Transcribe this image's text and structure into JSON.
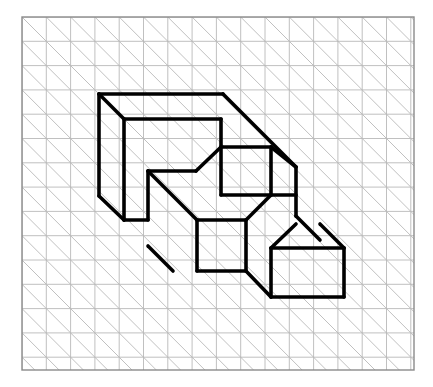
{
  "page": {
    "background_color": "#ffffff",
    "width": 433,
    "height": 387
  },
  "grid_panel": {
    "name": "grid-panel",
    "x": 22,
    "y": 17,
    "width": 392,
    "height": 353,
    "border_color": "#8a8a8a",
    "border_width": 1.4,
    "fill_color": "#ffffff",
    "cell_size": 24.3,
    "columns": 16,
    "rows": 14,
    "grid_line_color": "#b9b9b9",
    "grid_line_width": 0.9,
    "diagonal_color": "#b9b9b9",
    "diagonal_width": 0.9,
    "diagonal_direction": "top-left-to-bottom-right"
  },
  "figure": {
    "name": "isometric-block-figure",
    "stroke_color": "#000000",
    "stroke_width": 3.6,
    "fill_color": "none",
    "projection": "oblique-45-down-right",
    "unit": 24.3,
    "depth_step": 24.3,
    "outline_path": "M 99 94 L 223 94 L 296 167 L 296 216 L 344 216 L 344 297 L 271 297 L 197 271 L 173 271 L 124 220 L 99 196 Z",
    "outline_points": [
      {
        "x": 99,
        "y": 94,
        "label": "top-left-top-corner"
      },
      {
        "x": 223,
        "y": 94,
        "label": "top-right-top-corner"
      },
      {
        "x": 296,
        "y": 167,
        "label": "upper-right-depth-corner"
      },
      {
        "x": 296,
        "y": 216,
        "label": "right-step-top"
      },
      {
        "x": 344,
        "y": 216,
        "label": "far-right-top"
      },
      {
        "x": 344,
        "y": 297,
        "label": "far-right-bottom"
      },
      {
        "x": 271,
        "y": 297,
        "label": "bottom-right-front"
      },
      {
        "x": 197,
        "y": 271,
        "label": "bottom-mid-front"
      },
      {
        "x": 173,
        "y": 271,
        "label": "bottom-mid-left"
      },
      {
        "x": 124,
        "y": 220,
        "label": "bottom-left-front"
      },
      {
        "x": 99,
        "y": 196,
        "label": "left-bottom-corner"
      }
    ],
    "edges": [
      {
        "name": "top-edge-back",
        "x1": 99,
        "y1": 94,
        "x2": 223,
        "y2": 94
      },
      {
        "name": "top-right-diagonal",
        "x1": 223,
        "y1": 94,
        "x2": 296,
        "y2": 167
      },
      {
        "name": "left-edge-vertical",
        "x1": 99,
        "y1": 94,
        "x2": 99,
        "y2": 196
      },
      {
        "name": "left-bottom-diagonal",
        "x1": 99,
        "y1": 196,
        "x2": 124,
        "y2": 220
      },
      {
        "name": "left-foot-horizontal",
        "x1": 124,
        "y1": 220,
        "x2": 148,
        "y2": 220
      },
      {
        "name": "inner-top-diagonal",
        "x1": 99,
        "y1": 94,
        "x2": 124,
        "y2": 119
      },
      {
        "name": "inner-top-horizontal",
        "x1": 124,
        "y1": 119,
        "x2": 221,
        "y2": 119
      },
      {
        "name": "inner-right-vertical-upper",
        "x1": 221,
        "y1": 119,
        "x2": 221,
        "y2": 147
      },
      {
        "name": "inner-notch-diagonal",
        "x1": 221,
        "y1": 147,
        "x2": 196,
        "y2": 171
      },
      {
        "name": "inner-notch-horizontal",
        "x1": 196,
        "y1": 171,
        "x2": 148,
        "y2": 171
      },
      {
        "name": "inner-left-vertical",
        "x1": 124,
        "y1": 119,
        "x2": 124,
        "y2": 220
      },
      {
        "name": "notch-left-vertical",
        "x1": 148,
        "y1": 171,
        "x2": 148,
        "y2": 220
      },
      {
        "name": "notch-long-diagonal",
        "x1": 148,
        "y1": 171,
        "x2": 197,
        "y2": 220
      },
      {
        "name": "mid-front-top-horizontal",
        "x1": 197,
        "y1": 220,
        "x2": 246,
        "y2": 220
      },
      {
        "name": "mid-front-left-vertical",
        "x1": 197,
        "y1": 220,
        "x2": 197,
        "y2": 271
      },
      {
        "name": "mid-front-bottom-horizontal",
        "x1": 197,
        "y1": 271,
        "x2": 246,
        "y2": 271
      },
      {
        "name": "mid-front-right-vertical",
        "x1": 246,
        "y1": 220,
        "x2": 246,
        "y2": 271
      },
      {
        "name": "mid-top-diagonal-right",
        "x1": 246,
        "y1": 220,
        "x2": 271,
        "y2": 195
      },
      {
        "name": "upper-square-top",
        "x1": 221,
        "y1": 147,
        "x2": 271,
        "y2": 147
      },
      {
        "name": "upper-square-right",
        "x1": 271,
        "y1": 147,
        "x2": 271,
        "y2": 195
      },
      {
        "name": "upper-square-bottom",
        "x1": 221,
        "y1": 195,
        "x2": 271,
        "y2": 195
      },
      {
        "name": "upper-square-left",
        "x1": 221,
        "y1": 147,
        "x2": 221,
        "y2": 195
      },
      {
        "name": "upper-right-diagonal-to-depth",
        "x1": 271,
        "y1": 147,
        "x2": 296,
        "y2": 167
      },
      {
        "name": "right-depth-vertical",
        "x1": 296,
        "y1": 167,
        "x2": 296,
        "y2": 216
      },
      {
        "name": "right-step-horizontal",
        "x1": 271,
        "y1": 195,
        "x2": 296,
        "y2": 195
      },
      {
        "name": "far-right-diagonal-top",
        "x1": 296,
        "y1": 216,
        "x2": 320,
        "y2": 240
      },
      {
        "name": "far-right-top-horizontal",
        "x1": 271,
        "y1": 248,
        "x2": 344,
        "y2": 248
      },
      {
        "name": "far-right-vertical",
        "x1": 344,
        "y1": 248,
        "x2": 344,
        "y2": 297
      },
      {
        "name": "far-right-bottom-horizontal",
        "x1": 271,
        "y1": 297,
        "x2": 344,
        "y2": 297
      },
      {
        "name": "far-right-left-vertical",
        "x1": 271,
        "y1": 248,
        "x2": 271,
        "y2": 297
      },
      {
        "name": "far-right-upper-diagonal",
        "x1": 320,
        "y1": 224,
        "x2": 344,
        "y2": 248
      },
      {
        "name": "far-right-corner-diagonal",
        "x1": 271,
        "y1": 248,
        "x2": 296,
        "y2": 224
      },
      {
        "name": "mid-to-right-diagonal",
        "x1": 246,
        "y1": 271,
        "x2": 271,
        "y2": 297
      },
      {
        "name": "bottom-step-diagonal",
        "x1": 173,
        "y1": 271,
        "x2": 148,
        "y2": 246
      }
    ]
  }
}
